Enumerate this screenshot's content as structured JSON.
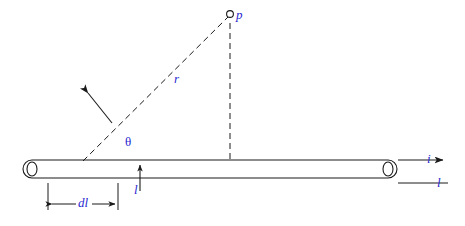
{
  "figure": {
    "type": "physics-diagram",
    "background_color": "#ffffff",
    "line_color": "#1a1a1a",
    "label_color": "#2a2ad0"
  },
  "labels": {
    "point_p": "p",
    "radius": "r",
    "angle": "θ",
    "current_arrow": "i",
    "wire_length": "l",
    "element_length": "dl",
    "perpendicular_distance": "l"
  },
  "elements": {
    "wire": "horizontal-rod",
    "point_marker": "small-circle",
    "dashed_lines": [
      "r-from-wire-to-p",
      "vertical-from-wire-to-p",
      "perpendicular-distance"
    ],
    "arrows": [
      "current-direction-arrow",
      "pointer-arrow-to-wire",
      "dl-dimension-arrows",
      "distance-arrow"
    ]
  }
}
